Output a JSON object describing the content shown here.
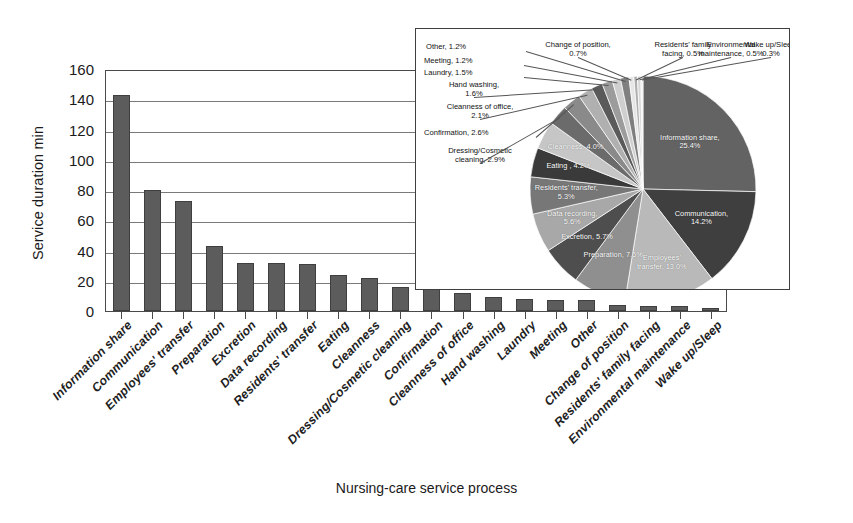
{
  "axes": {
    "ylabel": "Service duration min",
    "xlabel": "Nursing-care service process",
    "yticks": [
      "160",
      "140",
      "120",
      "100",
      "80",
      "60",
      "40",
      "20",
      "0"
    ]
  },
  "chart_data": {
    "type": "bar",
    "title": "",
    "xlabel": "Nursing-care service process",
    "ylabel": "Service duration min",
    "ylim": [
      0,
      160
    ],
    "ytick_step": 20,
    "grid": true,
    "legend": "none",
    "bar_color": "#5c5c5c",
    "categories": [
      "Information share",
      "Communication",
      "Employees' transfer",
      "Preparation",
      "Excretion",
      "Data recording",
      "Residents' transfer",
      "Eating",
      "Cleanness",
      "Dressing/Cosmetic cleaning",
      "Confirmation",
      "Cleanness of office",
      "Hand washing",
      "Laundry",
      "Meeting",
      "Other",
      "Change of position",
      "Residents' family facing",
      "Environmental maintenance",
      "Wake up/Sleep"
    ],
    "values": [
      143,
      80,
      73,
      43,
      32,
      32,
      31,
      24,
      22,
      16,
      15,
      12,
      9,
      8,
      7,
      7,
      4,
      3,
      3,
      2
    ],
    "inset": {
      "type": "pie",
      "start_angle_deg": 0,
      "direction": "clockwise",
      "labels": [
        "Information share",
        "Communication",
        "Employees' transfer",
        "Preparation",
        "Excretion",
        "Data recording",
        "Residents' transfer",
        "Eating",
        "Cleanness",
        "Dressing/Cosmetic cleaning",
        "Confirmation",
        "Cleanness of office",
        "Hand washing",
        "Laundry",
        "Meeting",
        "Other",
        "Change of position",
        "Residents' family facing",
        "Environmental maintenance",
        "Wake up/Sleep"
      ],
      "values": [
        25.4,
        14.2,
        13.0,
        7.6,
        5.7,
        5.6,
        5.3,
        4.2,
        4.0,
        2.9,
        2.6,
        2.1,
        1.6,
        1.5,
        1.2,
        1.2,
        0.7,
        0.5,
        0.5,
        0.3
      ],
      "colors": [
        "#636363",
        "#3f3f3f",
        "#b9b9b9",
        "#8f8f8f",
        "#4e4e4e",
        "#a8a8a8",
        "#777777",
        "#3a3a3a",
        "#c6c6c6",
        "#6b6b6b",
        "#8a8a8a",
        "#b0b0b0",
        "#5a5a5a",
        "#9c9c9c",
        "#cfcfcf",
        "#7f7f7f",
        "#e6e6e6",
        "#aeaeae",
        "#d8d8d8",
        "#efefef"
      ],
      "slice_labels": [
        {
          "text": "Information share,",
          "text2": "25.4%"
        },
        {
          "text": "Communication,",
          "text2": "14.2%"
        },
        {
          "text": "Employees'",
          "text2": "transfer, 13.0%"
        },
        {
          "text": "Preparation, 7.6%",
          "text2": ""
        },
        {
          "text": "Excretion, 5.7%",
          "text2": ""
        },
        {
          "text": "Data recording,",
          "text2": "5.6%"
        },
        {
          "text": "Residents' transfer,",
          "text2": "5.3%"
        },
        {
          "text": "Eating , 4.2%",
          "text2": ""
        },
        {
          "text": "Cleanness, 4.0%",
          "text2": ""
        }
      ],
      "callouts": [
        {
          "text": "Dressing/Cosmetic",
          "text2": "cleaning, 2.9%"
        },
        {
          "text": "Confirmation, 2.6%",
          "text2": ""
        },
        {
          "text": "Cleanness of office,",
          "text2": "2.1%"
        },
        {
          "text": "Hand washing,",
          "text2": "1.6%"
        },
        {
          "text": "Laundry, 1.5%",
          "text2": ""
        },
        {
          "text": "Meeting, 1.2%",
          "text2": ""
        },
        {
          "text": "Other, 1.2%",
          "text2": ""
        },
        {
          "text": "Change of position,",
          "text2": "0.7%"
        },
        {
          "text": "Residents' family",
          "text2": "facing, 0.5%"
        },
        {
          "text": "Environmental",
          "text2": "maintenance, 0.5%"
        },
        {
          "text": "Wake up/Sleep,",
          "text2": "0.3%"
        }
      ]
    }
  }
}
